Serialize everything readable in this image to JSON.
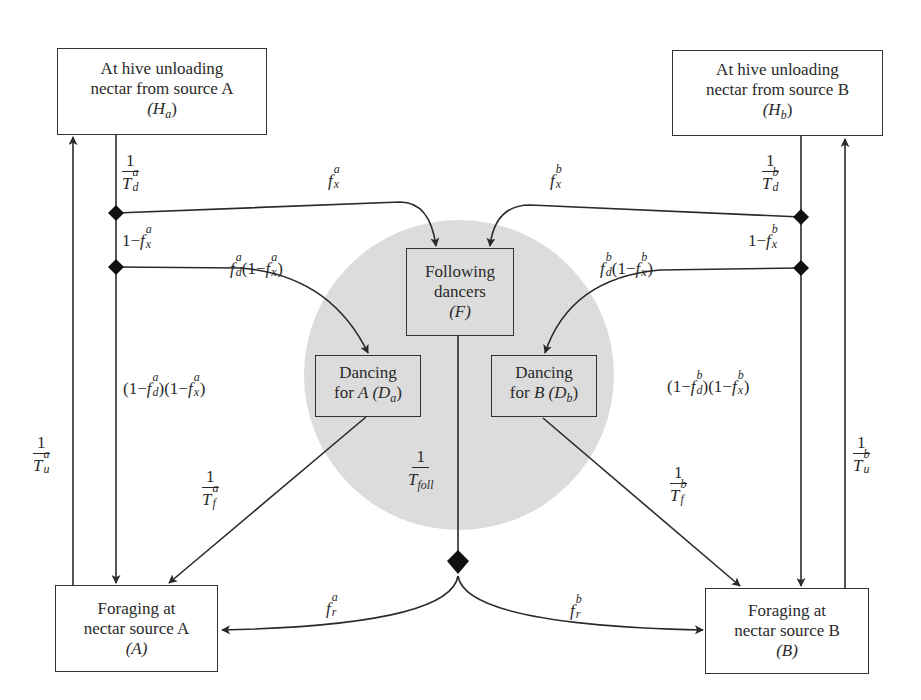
{
  "diagram": {
    "type": "state-transition-flow",
    "colors": {
      "line": "#2a2a2a",
      "circle_fill": "#dcdcdc",
      "box_border": "#333333",
      "junction": "#111111"
    },
    "nodes": {
      "hive_a": {
        "line1": "At hive unloading",
        "line2": "nectar from source A",
        "symbol": "(H",
        "sub": "a",
        "close": ")"
      },
      "hive_b": {
        "line1": "At hive unloading",
        "line2": "nectar from source B",
        "symbol": "(H",
        "sub": "b",
        "close": ")"
      },
      "following": {
        "line1": "Following",
        "line2": "dancers",
        "symbol": "(F)"
      },
      "dancing_a": {
        "line1": "Dancing",
        "line2_pre": "for ",
        "line2_sym": "A",
        "line2_post": " (D",
        "sub": "a",
        "close": ")"
      },
      "dancing_b": {
        "line1": "Dancing",
        "line2_pre": "for ",
        "line2_sym": "B",
        "line2_post": " (D",
        "sub": "b",
        "close": ")"
      },
      "forage_a": {
        "line1": "Foraging at",
        "line2": "nectar source A",
        "symbol": "(A)"
      },
      "forage_b": {
        "line1": "Foraging at",
        "line2": "nectar source B",
        "symbol": "(B)"
      }
    },
    "labels": {
      "one": "1",
      "td_a": {
        "base": "T",
        "sup": "a",
        "sub": "d"
      },
      "td_b": {
        "base": "T",
        "sup": "b",
        "sub": "d"
      },
      "tu_a": {
        "base": "T",
        "sup": "a",
        "sub": "u"
      },
      "tu_b": {
        "base": "T",
        "sup": "b",
        "sub": "u"
      },
      "tf_a": {
        "base": "T",
        "sup": "a",
        "sub": "f"
      },
      "tf_b": {
        "base": "T",
        "sup": "b",
        "sub": "f"
      },
      "tfoll": {
        "base": "T",
        "sub": "foll"
      },
      "fx_a": {
        "base": "f",
        "sup": "a",
        "sub": "x"
      },
      "fx_b": {
        "base": "f",
        "sup": "b",
        "sub": "x"
      },
      "one_minus_fx_a": {
        "pre": "1−",
        "base": "f",
        "sup": "a",
        "sub": "x"
      },
      "one_minus_fx_b": {
        "pre": "1−",
        "base": "f",
        "sup": "b",
        "sub": "x"
      },
      "fd_a_term": {
        "base": "f",
        "sup": "a",
        "sub": "d",
        "mid": "(1−",
        "base2": "f",
        "sup2": "a",
        "sub2": "x",
        "close": ")"
      },
      "fd_b_term": {
        "base": "f",
        "sup": "b",
        "sub": "d",
        "mid": "(1−",
        "base2": "f",
        "sup2": "b",
        "sub2": "x",
        "close": ")"
      },
      "stay_a": {
        "open": "(1−",
        "base": "f",
        "sup": "a",
        "sub": "d",
        "mid": ")(1−",
        "base2": "f",
        "sup2": "a",
        "sub2": "x",
        "close": ")"
      },
      "stay_b": {
        "open": "(1−",
        "base": "f",
        "sup": "b",
        "sub": "d",
        "mid": ")(1−",
        "base2": "f",
        "sup2": "b",
        "sub2": "x",
        "close": ")"
      },
      "fr_a": {
        "base": "f",
        "sup": "a",
        "sub": "r"
      },
      "fr_b": {
        "base": "f",
        "sup": "b",
        "sub": "r"
      }
    },
    "edges": [
      {
        "from": "hive_a",
        "to": "junction_a1",
        "rate": "1/T_d^a"
      },
      {
        "from": "junction_a1",
        "to": "following",
        "rate": "f_x^a"
      },
      {
        "from": "junction_a1",
        "to": "junction_a2",
        "rate": "1-f_x^a"
      },
      {
        "from": "junction_a2",
        "to": "dancing_a",
        "rate": "f_d^a(1-f_x^a)"
      },
      {
        "from": "junction_a2",
        "to": "forage_a",
        "rate": "(1-f_d^a)(1-f_x^a)"
      },
      {
        "from": "dancing_a",
        "to": "forage_a",
        "rate": "1/T_f^a"
      },
      {
        "from": "forage_a",
        "to": "hive_a",
        "rate": "1/T_u^a"
      },
      {
        "from": "hive_b",
        "to": "junction_b1",
        "rate": "1/T_d^b"
      },
      {
        "from": "junction_b1",
        "to": "following",
        "rate": "f_x^b"
      },
      {
        "from": "junction_b1",
        "to": "junction_b2",
        "rate": "1-f_x^b"
      },
      {
        "from": "junction_b2",
        "to": "dancing_b",
        "rate": "f_d^b(1-f_x^b)"
      },
      {
        "from": "junction_b2",
        "to": "forage_b",
        "rate": "(1-f_d^b)(1-f_x^b)"
      },
      {
        "from": "dancing_b",
        "to": "forage_b",
        "rate": "1/T_f^b"
      },
      {
        "from": "forage_b",
        "to": "hive_b",
        "rate": "1/T_u^b"
      },
      {
        "from": "following",
        "to": "junction_f",
        "rate": "1/T_foll"
      },
      {
        "from": "junction_f",
        "to": "forage_a",
        "rate": "f_r^a"
      },
      {
        "from": "junction_f",
        "to": "forage_b",
        "rate": "f_r^b"
      }
    ]
  }
}
